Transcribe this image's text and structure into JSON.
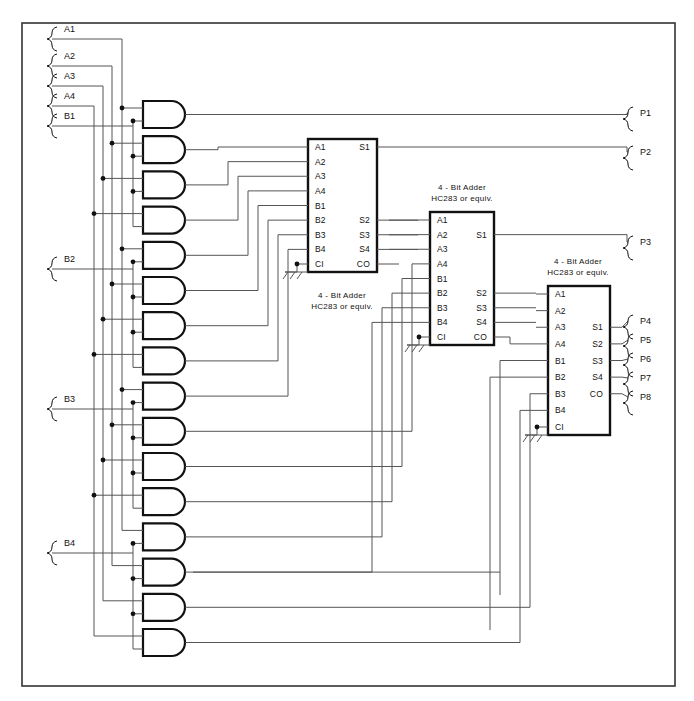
{
  "diagram": {
    "frame": {
      "x": 22,
      "y": 23,
      "w": 653,
      "h": 663
    },
    "colors": {
      "line": "#555555",
      "heavy": "#111111",
      "text": "#111111",
      "background": "#ffffff"
    }
  },
  "inputs": [
    {
      "name": "A1",
      "x": 62,
      "y": 33,
      "wire_x": 122
    },
    {
      "name": "A2",
      "x": 62,
      "y": 60,
      "wire_x": 112
    },
    {
      "name": "A3",
      "x": 62,
      "y": 80,
      "wire_x": 103
    },
    {
      "name": "A4",
      "x": 62,
      "y": 100,
      "wire_x": 94
    },
    {
      "name": "B1",
      "x": 62,
      "y": 120,
      "wire_x": 133
    },
    {
      "name": "B2",
      "x": 62,
      "y": 263,
      "wire_x": 133
    },
    {
      "name": "B3",
      "x": 62,
      "y": 403,
      "wire_x": 133
    },
    {
      "name": "B4",
      "x": 62,
      "y": 547,
      "wire_x": 133
    }
  ],
  "outputs": [
    {
      "name": "P1",
      "x": 638,
      "y": 113
    },
    {
      "name": "P2",
      "x": 638,
      "y": 152
    },
    {
      "name": "P3",
      "x": 638,
      "y": 242
    },
    {
      "name": "P4",
      "x": 638,
      "y": 321
    },
    {
      "name": "P5",
      "x": 638,
      "y": 340
    },
    {
      "name": "P6",
      "x": 638,
      "y": 359
    },
    {
      "name": "P7",
      "x": 638,
      "y": 378
    },
    {
      "name": "P8",
      "x": 638,
      "y": 397
    }
  ],
  "and_gates": {
    "count": 16,
    "first_y": 101,
    "pitch": 35.2,
    "x": 143,
    "w": 42,
    "h": 27,
    "labels": [
      "and-gate-1",
      "and-gate-2",
      "and-gate-3",
      "and-gate-4",
      "and-gate-5",
      "and-gate-6",
      "and-gate-7",
      "and-gate-8",
      "and-gate-9",
      "and-gate-10",
      "and-gate-11",
      "and-gate-12",
      "and-gate-13",
      "and-gate-14",
      "and-gate-15",
      "and-gate-16"
    ]
  },
  "adders": [
    {
      "id": "adder-1",
      "caption_line1": "4 - Bit  Adder",
      "caption_line2": "HC283 or equiv.",
      "caption_x": 342,
      "caption_y1": 298,
      "caption_y2": 309,
      "box": {
        "x": 308,
        "y": 139,
        "w": 69,
        "h": 133
      },
      "left_pins": [
        "A1",
        "A2",
        "A3",
        "A4",
        "B1",
        "B2",
        "B3",
        "B4",
        "CI"
      ],
      "right_pins": [
        {
          "name": "S1",
          "index": 0
        },
        {
          "name": "S2",
          "index": 5
        },
        {
          "name": "S3",
          "index": 6
        },
        {
          "name": "S4",
          "index": 7
        },
        {
          "name": "CO",
          "index": 8
        }
      ],
      "ground_x": 297,
      "ground_y": 272
    },
    {
      "id": "adder-2",
      "caption_line1": "4 - Bit  Adder",
      "caption_line2": "HC283 or equiv.",
      "caption_x": 462,
      "caption_y1": 190,
      "caption_y2": 201,
      "box": {
        "x": 430,
        "y": 212,
        "w": 64,
        "h": 133
      },
      "left_pins": [
        "A1",
        "A2",
        "A3",
        "A4",
        "B1",
        "B2",
        "B3",
        "B4",
        "CI"
      ],
      "right_pins": [
        {
          "name": "S1",
          "index": 1
        },
        {
          "name": "S2",
          "index": 5
        },
        {
          "name": "S3",
          "index": 6
        },
        {
          "name": "S4",
          "index": 7
        },
        {
          "name": "CO",
          "index": 8
        }
      ],
      "ground_x": 419,
      "ground_y": 345
    },
    {
      "id": "adder-3",
      "caption_line1": "4 - Bit  Adder",
      "caption_line2": "HC283 or equiv.",
      "caption_x": 578,
      "caption_y1": 264,
      "caption_y2": 275,
      "box": {
        "x": 548,
        "y": 286,
        "w": 62,
        "h": 149
      },
      "left_pins": [
        "A1",
        "A2",
        "A3",
        "A4",
        "B1",
        "B2",
        "B3",
        "B4",
        "CI"
      ],
      "right_pins": [
        {
          "name": "S1",
          "index": 2
        },
        {
          "name": "S2",
          "index": 3
        },
        {
          "name": "S3",
          "index": 4
        },
        {
          "name": "S4",
          "index": 5
        },
        {
          "name": "CO",
          "index": 6
        }
      ],
      "ground_x": 537,
      "ground_y": 435
    }
  ]
}
